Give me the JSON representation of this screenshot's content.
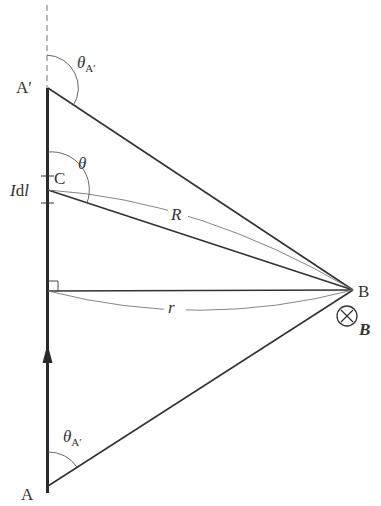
{
  "diagram": {
    "type": "biot-savart-straight-wire",
    "colors": {
      "line": "#333333",
      "thin": "#555555",
      "guide": "#777777",
      "background": "#ffffff"
    },
    "points": {
      "A_prime": {
        "label": "A′",
        "x": 47,
        "y": 88
      },
      "A": {
        "label": "A",
        "x": 48,
        "y": 486
      },
      "C": {
        "label": "C",
        "x": 48,
        "y": 190
      },
      "B": {
        "label": "B",
        "x": 353,
        "y": 290
      },
      "foot": {
        "x": 48,
        "y": 291
      }
    },
    "labels": {
      "a_prime": "A′",
      "a": "A",
      "c": "C",
      "b": "B",
      "theta": "θ",
      "theta_a_prime_top_main": "θ",
      "theta_a_prime_top_sub": "A′",
      "theta_a_prime_bottom_main": "θ",
      "theta_a_prime_bottom_sub": "A′",
      "idl_I": "I",
      "idl_d": "d",
      "idl_l": "l",
      "R": "R",
      "r": "r",
      "field_symbol": "⊗",
      "field_B": "B"
    },
    "segments": [
      {
        "name": "wire",
        "from": "A",
        "to": "A_prime",
        "style": "thick"
      },
      {
        "name": "extension",
        "from": "A_prime",
        "to": "top",
        "style": "dashed"
      },
      {
        "name": "A_prime-B",
        "from": "A_prime",
        "to": "B"
      },
      {
        "name": "C-B",
        "from": "C",
        "to": "B",
        "label": "R"
      },
      {
        "name": "foot-B",
        "from": "foot",
        "to": "B",
        "label": "r"
      },
      {
        "name": "A-B",
        "from": "A",
        "to": "B"
      }
    ],
    "current_direction": "up"
  }
}
